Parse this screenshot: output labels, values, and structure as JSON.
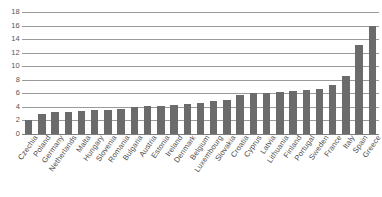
{
  "chart_data": {
    "type": "bar",
    "title": "",
    "subtitle": "",
    "xlabel": "",
    "ylabel": "",
    "ylim": [
      0,
      18
    ],
    "ytick_step": 2,
    "yticks": [
      0,
      2,
      4,
      6,
      8,
      10,
      12,
      14,
      16,
      18
    ],
    "ytick_labels": [
      "0",
      "2",
      "4",
      "6",
      "8",
      "10",
      "12",
      "14",
      "16",
      "18"
    ],
    "grid": true,
    "grid_axis": "y",
    "legend": false,
    "legend_position": "none",
    "bar_color": "#6b6b6b",
    "grid_color": "#9a9a9a",
    "axis_text_color": "#4d4d4d",
    "categories": [
      "Czechia",
      "Poland",
      "Germany",
      "Netherlands",
      "Malta",
      "Hungary",
      "Slovenia",
      "Romania",
      "Bulgaria",
      "Austria",
      "Estonia",
      "Ireland",
      "Denmark",
      "Belgium",
      "Luxembourg",
      "Slovakia",
      "Croatia",
      "Cyprus",
      "Latvia",
      "Lithuania",
      "Finland",
      "Portugal",
      "Sweden",
      "France",
      "Italy",
      "Spain",
      "Greece"
    ],
    "values": [
      2.0,
      2.9,
      3.3,
      3.3,
      3.4,
      3.5,
      3.6,
      3.7,
      4.0,
      4.1,
      4.2,
      4.3,
      4.4,
      4.6,
      4.8,
      5.0,
      5.7,
      6.0,
      6.1,
      6.2,
      6.3,
      6.5,
      6.7,
      7.3,
      8.6,
      13.1,
      16.0
    ]
  }
}
